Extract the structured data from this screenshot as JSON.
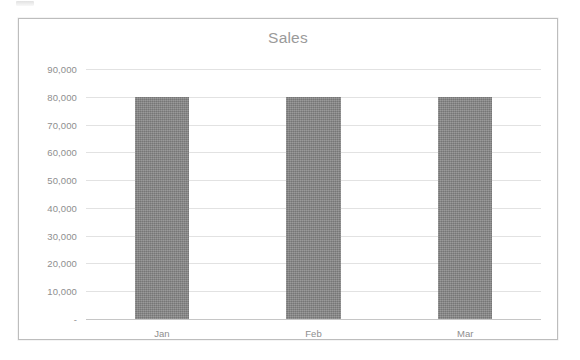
{
  "chart_data": {
    "type": "bar",
    "title": "Sales",
    "xlabel": "",
    "ylabel": "",
    "categories": [
      "Jan",
      "Feb",
      "Mar"
    ],
    "values": [
      80000,
      80000,
      80000
    ],
    "series": [
      {
        "name": "Sales",
        "values": [
          80000,
          80000,
          80000
        ]
      }
    ],
    "ylim": [
      0,
      90000
    ],
    "ytick_values": [
      90000,
      80000,
      70000,
      60000,
      50000,
      40000,
      30000,
      20000,
      10000,
      0
    ],
    "ytick_labels": [
      "90,000",
      "80,000",
      "70,000",
      "60,000",
      "50,000",
      "40,000",
      "30,000",
      "20,000",
      "10,000",
      "-"
    ],
    "grid": true,
    "legend": false,
    "legend_position": "none",
    "bar_color": "#828282",
    "gridline_color": "#e2e2e2",
    "axis_color": "#c6c6c6",
    "title_color": "#9a9a9a",
    "tick_label_color": "#8e8e8e",
    "plot_background": "#ffffff",
    "frame_border_color": "#bdbdbd"
  }
}
